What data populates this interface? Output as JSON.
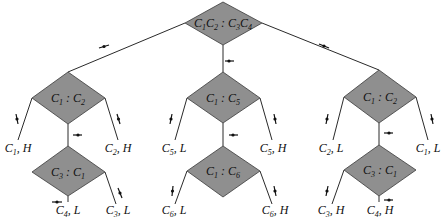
{
  "diagram": {
    "type": "decision-tree",
    "colors": {
      "node_fill": "#8f8f8f",
      "edge": "#2a2a2a",
      "background": "#ffffff"
    },
    "root": {
      "label": "C1C2 : C3C4",
      "parts": [
        [
          "C",
          "1"
        ],
        [
          "C",
          "2"
        ],
        [
          " : ",
          ""
        ],
        [
          "C",
          "3"
        ],
        [
          "C",
          "4"
        ]
      ]
    },
    "branches": [
      {
        "node": {
          "label": "C1 : C2",
          "parts": [
            [
              "C",
              "1"
            ],
            [
              " : ",
              ""
            ],
            [
              "C",
              "2"
            ]
          ]
        },
        "leaf_left": {
          "label": "C1, H",
          "parts": [
            [
              "C",
              "1"
            ],
            [
              ", H",
              ""
            ]
          ]
        },
        "leaf_right": {
          "label": "C2, H",
          "parts": [
            [
              "C",
              "2"
            ],
            [
              ", H",
              ""
            ]
          ]
        },
        "child": {
          "node": {
            "label": "C3 : C1",
            "parts": [
              [
                "C",
                "3"
              ],
              [
                " : ",
                ""
              ],
              [
                "C",
                "1"
              ]
            ]
          },
          "leaf_bottom": {
            "label": "C4, L",
            "parts": [
              [
                "C",
                "4"
              ],
              [
                ", L",
                ""
              ]
            ]
          },
          "leaf_right": {
            "label": "C3, L",
            "parts": [
              [
                "C",
                "3"
              ],
              [
                ", L",
                ""
              ]
            ]
          }
        }
      },
      {
        "node": {
          "label": "C1 : C5",
          "parts": [
            [
              "C",
              "1"
            ],
            [
              " : ",
              ""
            ],
            [
              "C",
              "5"
            ]
          ]
        },
        "leaf_left": {
          "label": "C5, L",
          "parts": [
            [
              "C",
              "5"
            ],
            [
              ", L",
              ""
            ]
          ]
        },
        "leaf_right": {
          "label": "C5, H",
          "parts": [
            [
              "C",
              "5"
            ],
            [
              ", H",
              ""
            ]
          ]
        },
        "child": {
          "node": {
            "label": "C1 : C6",
            "parts": [
              [
                "C",
                "1"
              ],
              [
                " : ",
                ""
              ],
              [
                "C",
                "6"
              ]
            ]
          },
          "leaf_left": {
            "label": "C6, L",
            "parts": [
              [
                "C",
                "6"
              ],
              [
                ", L",
                ""
              ]
            ]
          },
          "leaf_right": {
            "label": "C6, H",
            "parts": [
              [
                "C",
                "6"
              ],
              [
                ", H",
                ""
              ]
            ]
          }
        }
      },
      {
        "node": {
          "label": "C1 : C2",
          "parts": [
            [
              "C",
              "1"
            ],
            [
              " : ",
              ""
            ],
            [
              "C",
              "2"
            ]
          ]
        },
        "leaf_left": {
          "label": "C2, L",
          "parts": [
            [
              "C",
              "2"
            ],
            [
              ", L",
              ""
            ]
          ]
        },
        "leaf_right": {
          "label": "C1, L",
          "parts": [
            [
              "C",
              "1"
            ],
            [
              ", L",
              ""
            ]
          ]
        },
        "child": {
          "node": {
            "label": "C3 : C1",
            "parts": [
              [
                "C",
                "3"
              ],
              [
                " : ",
                ""
              ],
              [
                "C",
                "1"
              ]
            ]
          },
          "leaf_left": {
            "label": "C3, H",
            "parts": [
              [
                "C",
                "3"
              ],
              [
                ", H",
                ""
              ]
            ]
          },
          "leaf_bottom": {
            "label": "C4, H",
            "parts": [
              [
                "C",
                "4"
              ],
              [
                ", H",
                ""
              ]
            ]
          }
        }
      }
    ]
  }
}
